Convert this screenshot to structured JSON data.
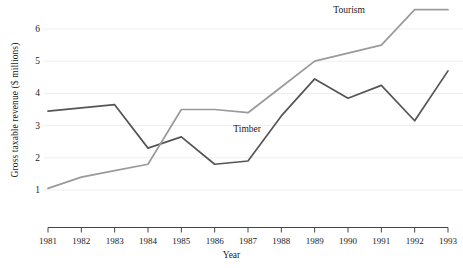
{
  "chart_data": {
    "type": "line",
    "title": "",
    "xlabel": "Year",
    "ylabel": "Gross taxable revenue ($ millions)",
    "categories": [
      1981,
      1982,
      1983,
      1984,
      1985,
      1986,
      1987,
      1988,
      1989,
      1990,
      1991,
      1992,
      1993
    ],
    "x_tick_labels": [
      "1981",
      "1982",
      "1983",
      "1984",
      "1985",
      "1986",
      "1987",
      "1988",
      "1989",
      "1990",
      "1991",
      "1992",
      "1993"
    ],
    "y_tick_labels": [
      "1",
      "2",
      "3",
      "4",
      "5",
      "6"
    ],
    "y_ticks": [
      1,
      2,
      3,
      4,
      5,
      6
    ],
    "xlim": [
      1981,
      1993
    ],
    "ylim": [
      0.55,
      6.95
    ],
    "grid": "horizontal",
    "legend_position": "inline-annotations",
    "series": [
      {
        "name": "Timber",
        "color": "#555555",
        "label_x": 1988.0,
        "label_y": 2.85,
        "values": [
          3.45,
          3.55,
          3.65,
          2.3,
          2.65,
          1.8,
          1.9,
          3.3,
          4.45,
          3.85,
          4.25,
          3.15,
          4.7
        ]
      },
      {
        "name": "Tourism",
        "color": "#9a9a9a",
        "label_x": 1991.0,
        "label_y": 6.55,
        "values": [
          1.05,
          1.4,
          1.6,
          1.8,
          3.5,
          3.5,
          3.4,
          4.2,
          5.0,
          5.25,
          5.5,
          6.6,
          6.6
        ]
      }
    ],
    "annotations": [
      {
        "text": "Tourism",
        "series": "Tourism"
      },
      {
        "text": "Timber",
        "series": "Timber"
      }
    ],
    "gridline_color": "#eeeeee",
    "axis_color": "#444444",
    "background": "#ffffff"
  }
}
